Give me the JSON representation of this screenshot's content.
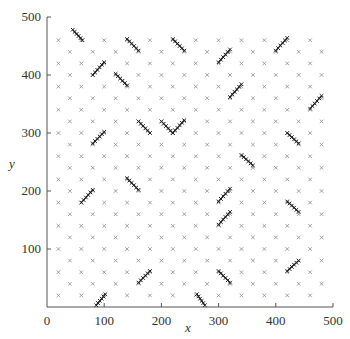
{
  "chart_data": {
    "type": "scatter",
    "title": "",
    "xlabel": "x",
    "ylabel": "y",
    "xlim": [
      0,
      500
    ],
    "ylim": [
      0,
      500
    ],
    "xticks": [
      0,
      100,
      200,
      300,
      400,
      500
    ],
    "yticks": [
      100,
      200,
      300,
      400,
      500
    ],
    "xtick_labels": [
      "0",
      "100",
      "200",
      "300",
      "400",
      "500"
    ],
    "ytick_labels": [
      "100",
      "200",
      "300",
      "400",
      "500"
    ],
    "grid": false,
    "legend": null,
    "marker": "x",
    "colors": {
      "grid_points": "#8a8a8a",
      "segments": "#222222",
      "axis": "#555555",
      "text": "#333333"
    },
    "series": [
      {
        "name": "lattice points",
        "description": "staggered lattice: x in 20..480 step 20, y in 20..460 step 20, kept where (x/20 + y/20) is even",
        "lattice": {
          "x_start": 20,
          "x_end": 480,
          "y_start": 20,
          "y_end": 460,
          "step": 20,
          "parity": "even"
        }
      },
      {
        "name": "dense segments",
        "description": "short diagonal runs of densely packed x markers",
        "segments": [
          [
            [
              45,
              478
            ],
            [
              62,
              460
            ]
          ],
          [
            [
              140,
              462
            ],
            [
              160,
              442
            ]
          ],
          [
            [
              80,
              400
            ],
            [
              100,
              422
            ]
          ],
          [
            [
              120,
              402
            ],
            [
              140,
              382
            ]
          ],
          [
            [
              220,
              462
            ],
            [
              240,
              442
            ]
          ],
          [
            [
              300,
              422
            ],
            [
              320,
              444
            ]
          ],
          [
            [
              320,
              362
            ],
            [
              340,
              384
            ]
          ],
          [
            [
              400,
              442
            ],
            [
              420,
              464
            ]
          ],
          [
            [
              460,
              342
            ],
            [
              480,
              364
            ]
          ],
          [
            [
              420,
              300
            ],
            [
              440,
              282
            ]
          ],
          [
            [
              80,
              282
            ],
            [
              100,
              302
            ]
          ],
          [
            [
              160,
              320
            ],
            [
              180,
              300
            ]
          ],
          [
            [
              200,
              320
            ],
            [
              220,
              300
            ]
          ],
          [
            [
              220,
              300
            ],
            [
              240,
              322
            ]
          ],
          [
            [
              340,
              262
            ],
            [
              360,
              244
            ]
          ],
          [
            [
              420,
              182
            ],
            [
              440,
              164
            ]
          ],
          [
            [
              60,
              180
            ],
            [
              80,
              202
            ]
          ],
          [
            [
              140,
              222
            ],
            [
              160,
              202
            ]
          ],
          [
            [
              300,
              182
            ],
            [
              320,
              204
            ]
          ],
          [
            [
              300,
              142
            ],
            [
              320,
              164
            ]
          ],
          [
            [
              420,
              62
            ],
            [
              440,
              80
            ]
          ],
          [
            [
              300,
              62
            ],
            [
              320,
              42
            ]
          ],
          [
            [
              262,
              22
            ],
            [
              276,
              3
            ]
          ],
          [
            [
              160,
              42
            ],
            [
              180,
              62
            ]
          ],
          [
            [
              86,
              3
            ],
            [
              102,
              22
            ]
          ]
        ]
      }
    ]
  },
  "plot_area": {
    "left_px": 47,
    "right_px": 333,
    "top_px": 17,
    "bottom_px": 307
  }
}
